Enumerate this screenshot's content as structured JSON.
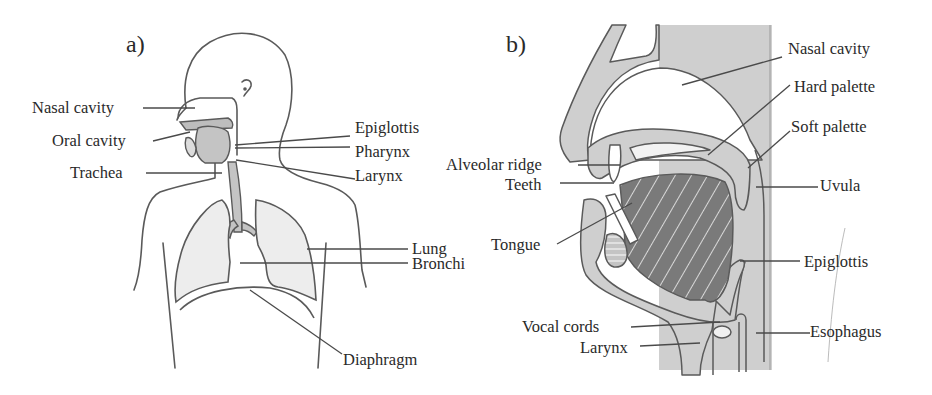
{
  "panel_a": {
    "tag": "a)",
    "title": "Respiratory system (full body)",
    "labels": {
      "nasal_cavity": "Nasal cavity",
      "oral_cavity": "Oral cavity",
      "trachea": "Trachea",
      "epiglottis": "Epiglottis",
      "pharynx": "Pharynx",
      "larynx": "Larynx",
      "lung": "Lung",
      "bronchi": "Bronchi",
      "diaphragm": "Diaphragm"
    }
  },
  "panel_b": {
    "tag": "b)",
    "title": "Vocal tract (sagittal section)",
    "labels": {
      "nasal_cavity": "Nasal cavity",
      "hard_palette": "Hard palette",
      "soft_palette": "Soft palette",
      "alveolar_ridge": "Alveolar ridge",
      "teeth": "Teeth",
      "uvula": "Uvula",
      "tongue": "Tongue",
      "epiglottis": "Epiglottis",
      "vocal_cords": "Vocal cords",
      "esophagus": "Esophagus",
      "larynx": "Larynx"
    }
  },
  "colors": {
    "outline": "#555555",
    "tissue": "#c8c8c8",
    "tongue": "#7a7a7a",
    "lung_fill": "#ececec",
    "background": "#ffffff"
  }
}
